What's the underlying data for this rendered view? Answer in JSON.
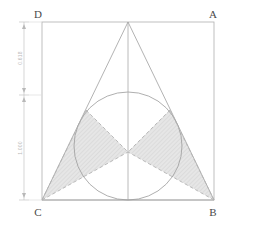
{
  "figure": {
    "background": "#ffffff",
    "line_color": "#9a9a9a",
    "square_color": "#a8a8a8",
    "circle_color": "#8e8e8e",
    "dashed_color": "#b0b0b0",
    "shade_fill": "#e4e4e4",
    "hatch_color": "#cfcfcf",
    "dimension_color": "#bdbdbd",
    "label_color": "#4a4a4a"
  },
  "vertices": {
    "A": {
      "label": "A",
      "x": 214,
      "y": 22
    },
    "B": {
      "label": "B",
      "x": 214,
      "y": 200
    },
    "C": {
      "label": "C",
      "x": 42,
      "y": 200
    },
    "D": {
      "label": "D",
      "x": 42,
      "y": 22
    },
    "apex": {
      "label": "",
      "x": 128,
      "y": 22
    }
  },
  "corner_labels": [
    {
      "name": "vertex-label-d",
      "text": "D",
      "x": 38,
      "y": 18
    },
    {
      "name": "vertex-label-a",
      "text": "A",
      "x": 211,
      "y": 18
    },
    {
      "name": "vertex-label-c",
      "text": "C",
      "x": 38,
      "y": 214
    },
    {
      "name": "vertex-label-b",
      "text": "B",
      "x": 211,
      "y": 214
    }
  ],
  "square": {
    "name": "bounding-square",
    "left": 42,
    "top": 22,
    "right": 214,
    "bottom": 200,
    "width": 172,
    "height": 178
  },
  "triangle": {
    "name": "isosceles-triangle",
    "points": "128,22 42,200 214,200",
    "apex_x": 128,
    "apex_y": 22,
    "base_left_x": 42,
    "base_right_x": 214,
    "base_y": 200
  },
  "axis_line": {
    "name": "vertical-axis",
    "x": 128,
    "y1": 22,
    "y2": 200
  },
  "incircle": {
    "name": "incircle",
    "cx": 128,
    "cy": 146,
    "r": 54,
    "top_y": 92,
    "bottom_y": 200
  },
  "bowtie": {
    "name": "shaded-bowtie",
    "center_x": 128,
    "center_y": 152,
    "left_polygon": "42,200 86,110 128,152",
    "right_polygon": "214,200 170,110 128,152",
    "left_lower_polygon": "42,200 128,152 86,190",
    "right_lower_polygon": "214,200 128,152 170,190"
  },
  "dimensions": {
    "name": "dimension-stack",
    "axis_x": 24,
    "top_y": 22,
    "mid_y": 95,
    "bottom_y": 200,
    "entries": [
      {
        "name": "dimension-upper",
        "value": "0.618",
        "label_x": 22,
        "label_y": 58,
        "from_y": 22,
        "to_y": 95
      },
      {
        "name": "dimension-lower",
        "value": "1.000",
        "label_x": 22,
        "label_y": 148,
        "from_y": 95,
        "to_y": 200
      }
    ]
  }
}
